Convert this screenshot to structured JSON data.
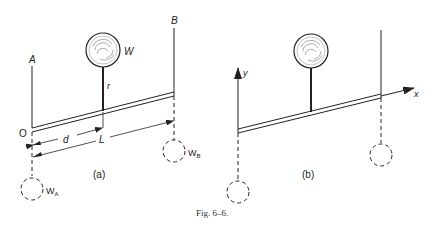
{
  "figure": {
    "caption": "Fig. 6–6.",
    "panels": [
      {
        "id": "a",
        "label": "(a)",
        "labels": {
          "support_a": "A",
          "support_b": "B",
          "weight": "W",
          "rod": "r",
          "origin": "O",
          "distance_d": "d",
          "length_L": "L",
          "weight_a": "W",
          "weight_a_sub": "A",
          "weight_b": "W",
          "weight_b_sub": "B"
        }
      },
      {
        "id": "b",
        "label": "(b)",
        "labels": {
          "axis_y": "y",
          "axis_x": "x"
        }
      }
    ]
  },
  "colors": {
    "ink": "#222222",
    "background": "#ffffff"
  }
}
